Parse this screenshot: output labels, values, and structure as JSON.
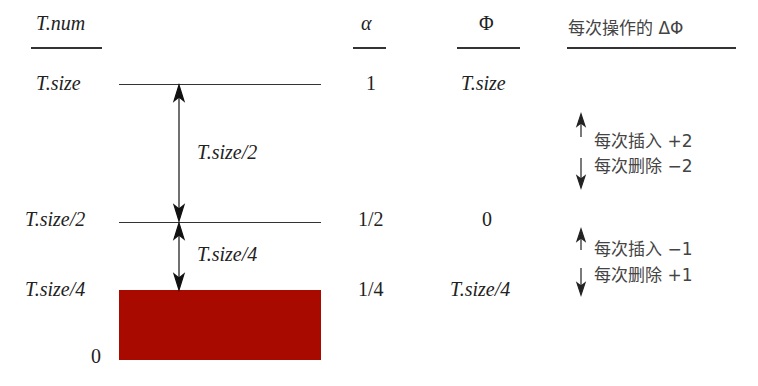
{
  "headers": {
    "tnum": "T.num",
    "alpha": "α",
    "phi": "Φ",
    "delta_phi": "每次操作的 ΔΦ"
  },
  "levels": [
    {
      "tnum": "T.size",
      "alpha": "1",
      "phi": "T.size"
    },
    {
      "tnum": "T.size/2",
      "alpha": "1/2",
      "phi": "0"
    },
    {
      "tnum": "T.size/4",
      "alpha": "1/4",
      "phi": "T.size/4"
    },
    {
      "tnum": "0"
    }
  ],
  "intervals": [
    {
      "label": "T.size/2"
    },
    {
      "label": "T.size/4"
    }
  ],
  "delta_notes": [
    {
      "insert": "每次插入 +2",
      "delete": "每次删除 −2"
    },
    {
      "insert": "每次插入 −1",
      "delete": "每次删除 +1"
    }
  ],
  "colors": {
    "filled_bar": "#a80a00",
    "line": "#333333"
  }
}
